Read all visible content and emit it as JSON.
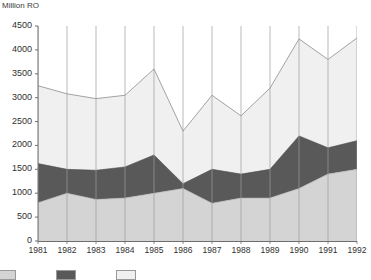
{
  "chart_data": {
    "type": "area",
    "title": "",
    "ylabel": "Million RO",
    "xlabel": "",
    "stacked": true,
    "grid": true,
    "grid_orientation": "vertical",
    "legend_position": "bottom",
    "ylim": [
      0,
      4500
    ],
    "ytick_step": 500,
    "yticks": [
      0,
      500,
      1000,
      1500,
      2000,
      2500,
      3000,
      3500,
      4000,
      4500
    ],
    "categories": [
      "1981",
      "1982",
      "1983",
      "1984",
      "1985",
      "1986",
      "1987",
      "1988",
      "1989",
      "1990",
      "1991",
      "1992"
    ],
    "series": [
      {
        "name": "series-bottom",
        "color": "#d4d4d4",
        "values": [
          800,
          1000,
          870,
          900,
          1000,
          1100,
          790,
          900,
          900,
          1100,
          1400,
          1500
        ]
      },
      {
        "name": "series-middle",
        "color": "#595959",
        "values": [
          820,
          500,
          610,
          650,
          800,
          100,
          710,
          500,
          600,
          1100,
          550,
          600
        ]
      },
      {
        "name": "series-top",
        "color": "#f0f0f0",
        "values": [
          1630,
          1580,
          1500,
          1500,
          1800,
          1100,
          1550,
          1220,
          1700,
          2030,
          1850,
          2150
        ]
      }
    ],
    "cumulative": {
      "bottom": [
        800,
        1000,
        870,
        900,
        1000,
        1100,
        790,
        900,
        900,
        1100,
        1400,
        1500
      ],
      "middle": [
        1620,
        1500,
        1480,
        1550,
        1800,
        1200,
        1500,
        1400,
        1500,
        2200,
        1950,
        2100
      ],
      "total": [
        3250,
        3080,
        2980,
        3050,
        3600,
        2300,
        3050,
        2620,
        3200,
        4230,
        3800,
        4250
      ]
    },
    "colors": {
      "bottom_band": "#d4d4d4",
      "middle_band": "#595959",
      "top_band": "#f0f0f0",
      "gridline": "#9b9b9b",
      "axis": "#6e6e6e",
      "text": "#2f2f2f",
      "background": "#ffffff"
    }
  },
  "legend": {
    "items": [
      {
        "name": "legend-swatch-bottom",
        "color": "#d4d4d4",
        "label": ""
      },
      {
        "name": "legend-swatch-middle",
        "color": "#595959",
        "label": ""
      },
      {
        "name": "legend-swatch-top",
        "color": "#f0f0f0",
        "label": ""
      }
    ]
  }
}
